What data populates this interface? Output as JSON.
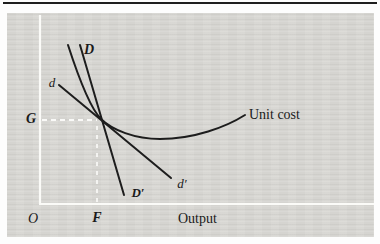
{
  "figure": {
    "type": "economics-cost-demand-diagram",
    "colors": {
      "page_background": "#fdfdfd",
      "panel_background": "#d8d7d3",
      "ink": "#1d1d1d",
      "axis_white": "#fbfbf8"
    },
    "axis": {
      "origin_label": "O",
      "x_axis_label": "Output",
      "x_tick_label": "F",
      "y_tick_label": "G"
    },
    "curves": [
      {
        "id": "DD-prime",
        "start_label": "D",
        "end_label": "D′"
      },
      {
        "id": "dd-prime",
        "start_label": "d",
        "end_label": "d′"
      },
      {
        "id": "unit-cost",
        "label": "Unit cost"
      }
    ]
  }
}
